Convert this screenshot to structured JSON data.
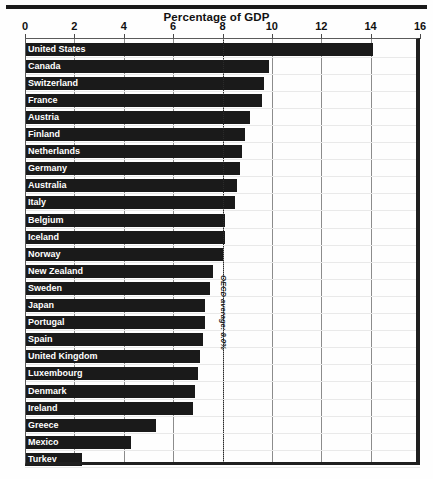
{
  "chart_data": {
    "type": "bar",
    "orientation": "horizontal",
    "title": "Percentage of GDP",
    "xlabel": "",
    "ylabel": "",
    "xlim": [
      0,
      16
    ],
    "xticks": [
      0,
      2,
      4,
      6,
      8,
      10,
      12,
      14,
      16
    ],
    "grid": true,
    "grid_axis": "x",
    "legend": "none",
    "bar_color": "#1a1a1a",
    "categories": [
      "United States",
      "Canada",
      "Switzerland",
      "France",
      "Austria",
      "Finland",
      "Netherlands",
      "Germany",
      "Australia",
      "Italy",
      "Belgium",
      "Iceland",
      "Norway",
      "New Zealand",
      "Sweden",
      "Japan",
      "Portugal",
      "Spain",
      "United Kingdom",
      "Luxembourg",
      "Denmark",
      "Ireland",
      "Greece",
      "Mexico",
      "Turkey"
    ],
    "values": [
      14.1,
      9.9,
      9.7,
      9.6,
      9.1,
      8.9,
      8.8,
      8.7,
      8.6,
      8.5,
      8.1,
      8.1,
      8.0,
      7.6,
      7.5,
      7.3,
      7.3,
      7.2,
      7.1,
      7.0,
      6.9,
      6.8,
      5.3,
      4.3,
      2.3
    ],
    "annotation": {
      "label": "OECD average: 8.0%",
      "value": 8.0,
      "style": "dotted-vertical-line"
    }
  }
}
